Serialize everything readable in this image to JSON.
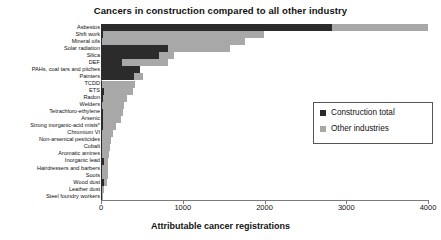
{
  "chart_data": {
    "type": "bar",
    "orientation": "horizontal",
    "stacked": true,
    "title": "Cancers in construction compared to all other industry",
    "xlabel": "Attributable cancer registrations",
    "ylabel": "",
    "xlim": [
      0,
      4000
    ],
    "xticks": [
      0,
      1000,
      2000,
      3000,
      4000
    ],
    "xtick_labels": [
      "0",
      "1000",
      "2000",
      "3000",
      "4000"
    ],
    "grid": false,
    "legend_position": "right",
    "categories": [
      "Asbestos",
      "Shift work",
      "Mineral oils",
      "Solar radiation",
      "Silica",
      "DEF",
      "PAHs, coal tars and pitches",
      "Painters",
      "TCDD",
      "ETS",
      "Radon",
      "Welders",
      "Tetrachloro-ethylene",
      "Arsenic",
      "Strong inorganic-acid mists*",
      "Chromium VI",
      "Non-arsenical pesticides",
      "Cobalt",
      "Aromatic amines",
      "Inorganic lead",
      "Hairdressers and barbers",
      "Soots",
      "Wood dust",
      "Leather dust",
      "Steel foundry workers"
    ],
    "series": [
      {
        "name": "Construction total",
        "color": "#2b2b2b",
        "values": [
          2830,
          20,
          15,
          820,
          710,
          255,
          480,
          400,
          10,
          40,
          20,
          15,
          20,
          30,
          20,
          15,
          10,
          10,
          10,
          40,
          10,
          15,
          40,
          15,
          10
        ]
      },
      {
        "name": "Other industries",
        "color": "#a8a8a8",
        "values": [
          1170,
          1980,
          1745,
          760,
          180,
          565,
          0,
          110,
          410,
          350,
          300,
          265,
          245,
          210,
          165,
          130,
          110,
          100,
          90,
          50,
          75,
          70,
          35,
          25,
          10
        ]
      }
    ],
    "totals": [
      4000,
      2000,
      1760,
      1580,
      890,
      820,
      480,
      510,
      420,
      390,
      320,
      280,
      265,
      240,
      185,
      145,
      120,
      110,
      100,
      90,
      85,
      85,
      75,
      40,
      20
    ]
  },
  "legend": {
    "items": [
      {
        "label": "Construction total",
        "color": "#2b2b2b"
      },
      {
        "label": "Other industries",
        "color": "#a8a8a8"
      }
    ]
  }
}
